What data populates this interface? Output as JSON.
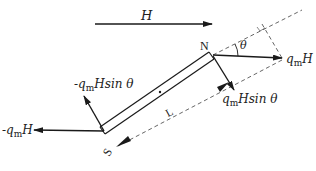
{
  "diagram": {
    "type": "physics-force-diagram",
    "field": {
      "label": "H",
      "direction": "right"
    },
    "magnet": {
      "north_label": "N",
      "south_label": "S",
      "length_label": "L",
      "angle_label": "θ"
    },
    "forces": {
      "north_force": {
        "prefix": "",
        "q": "q",
        "q_sub": "m",
        "tail": "H"
      },
      "north_perp": {
        "prefix": "",
        "q": "q",
        "q_sub": "m",
        "tail": "Hsin θ"
      },
      "south_force": {
        "prefix": "-",
        "q": "q",
        "q_sub": "m",
        "tail": "H"
      },
      "south_perp": {
        "prefix": "-",
        "q": "q",
        "q_sub": "m",
        "tail": "Hsin θ"
      }
    },
    "colors": {
      "line": "#1a1a1a",
      "dashed": "#555555",
      "background": "#ffffff"
    }
  }
}
